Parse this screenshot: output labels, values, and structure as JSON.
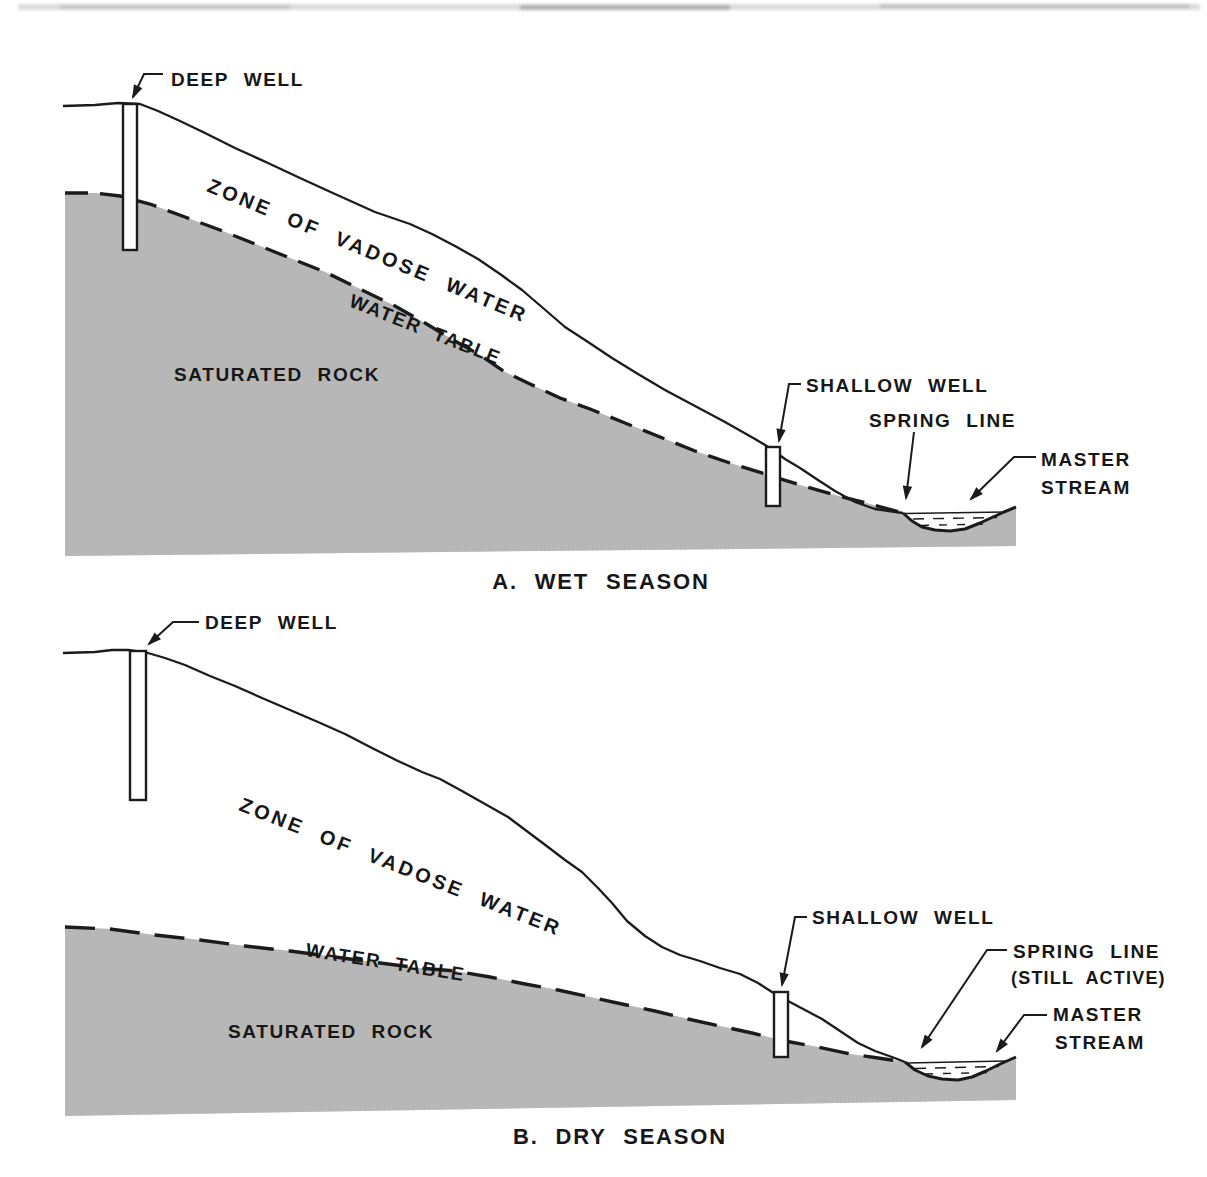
{
  "figure": {
    "type": "hydrogeology-cross-section-diagram",
    "colors": {
      "rock_gray": "#b9b9b9",
      "rock_dot": "#a3a3a3",
      "ink": "#1b1b1b",
      "paper": "#ffffff"
    },
    "panel_a": {
      "caption": "A. WET SEASON",
      "deep_well": "DEEP WELL",
      "zone_of_vadose_water": "ZONE OF VADOSE WATER",
      "water_table": "WATER TABLE",
      "saturated_rock": "SATURATED ROCK",
      "shallow_well": "SHALLOW WELL",
      "spring_line": "SPRING LINE",
      "master_stream_line1": "MASTER",
      "master_stream_line2": "STREAM"
    },
    "panel_b": {
      "caption": "B. DRY SEASON",
      "deep_well": "DEEP WELL",
      "zone_of_vadose_water": "ZONE OF VADOSE WATER",
      "water_table": "WATER TABLE",
      "saturated_rock": "SATURATED ROCK",
      "shallow_well": "SHALLOW WELL",
      "spring_line": "SPRING LINE",
      "spring_line_note": "(STILL ACTIVE)",
      "master_stream_line1": "MASTER",
      "master_stream_line2": "STREAM"
    }
  }
}
